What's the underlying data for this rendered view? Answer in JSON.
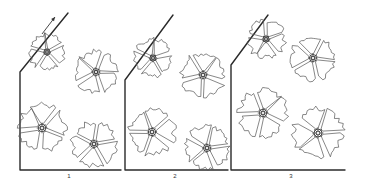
{
  "figure": {
    "panels": [
      {
        "label": "1",
        "frame": {
          "vx": 20,
          "top": 72,
          "roof_x": 68,
          "roof_y": 13,
          "bottom_y": 170,
          "right_x": 121
        },
        "arrow": {
          "x1": 42,
          "y1": 34,
          "x2": 55,
          "y2": 17
        },
        "label_x": 69,
        "flowers": [
          {
            "cx": 47,
            "cy": 52,
            "r": 18,
            "rot": 10
          },
          {
            "cx": 96,
            "cy": 72,
            "r": 21,
            "rot": 40
          },
          {
            "cx": 42,
            "cy": 128,
            "r": 24,
            "rot": -10
          },
          {
            "cx": 94,
            "cy": 144,
            "r": 22,
            "rot": 25
          }
        ]
      },
      {
        "label": "2",
        "frame": {
          "vx": 125,
          "top": 80,
          "roof_x": 173,
          "roof_y": 15,
          "bottom_y": 170,
          "right_x": 228
        },
        "label_x": 175,
        "flowers": [
          {
            "cx": 153,
            "cy": 58,
            "r": 19,
            "rot": 20
          },
          {
            "cx": 203,
            "cy": 75,
            "r": 22,
            "rot": 55
          },
          {
            "cx": 152,
            "cy": 132,
            "r": 23,
            "rot": 0
          },
          {
            "cx": 207,
            "cy": 148,
            "r": 22,
            "rot": 30
          }
        ]
      },
      {
        "label": "3",
        "frame": {
          "vx": 231,
          "top": 65,
          "roof_x": 268,
          "roof_y": 15,
          "bottom_y": 170,
          "right_x": 345
        },
        "label_x": 291,
        "flowers": [
          {
            "cx": 266,
            "cy": 39,
            "r": 19,
            "rot": 15
          },
          {
            "cx": 313,
            "cy": 58,
            "r": 22,
            "rot": 45
          },
          {
            "cx": 263,
            "cy": 113,
            "r": 24,
            "rot": -5
          },
          {
            "cx": 318,
            "cy": 133,
            "r": 25,
            "rot": 35
          }
        ]
      }
    ]
  }
}
